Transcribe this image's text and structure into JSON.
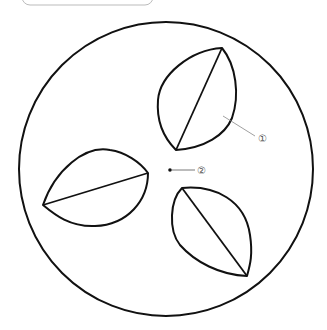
{
  "diagram": {
    "labels": [
      {
        "id": "label-1",
        "text": "①",
        "target": "leaf piece"
      },
      {
        "id": "label-2",
        "text": "②",
        "target": "center point"
      }
    ],
    "colors": {
      "stroke": "#111111",
      "leader": "#888888",
      "label": "#555555",
      "frame": "#bbbbbb"
    }
  }
}
